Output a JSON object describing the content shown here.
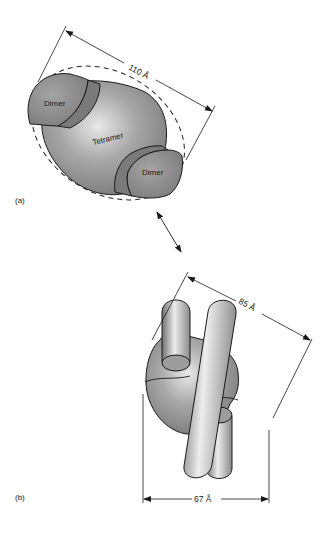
{
  "figure": {
    "panel_a": {
      "label": "(a)",
      "components": {
        "dimer_top": "Dimer",
        "tetramer": "Tetramer",
        "dimer_bottom": "Dimer"
      },
      "dimension": "110 Å"
    },
    "panel_b": {
      "label": "(b)",
      "dimension_diagonal": "85 Å",
      "dimension_width": "67 Å"
    },
    "relation_arrow": "double-headed-arrow"
  },
  "colors": {
    "body_fill": "#9a9a9a",
    "dimer_fill": "#8e8e8e",
    "band_fill": "#7a7a7a",
    "outline": "#1a1a1a",
    "highlight": "#e6e6e6"
  }
}
